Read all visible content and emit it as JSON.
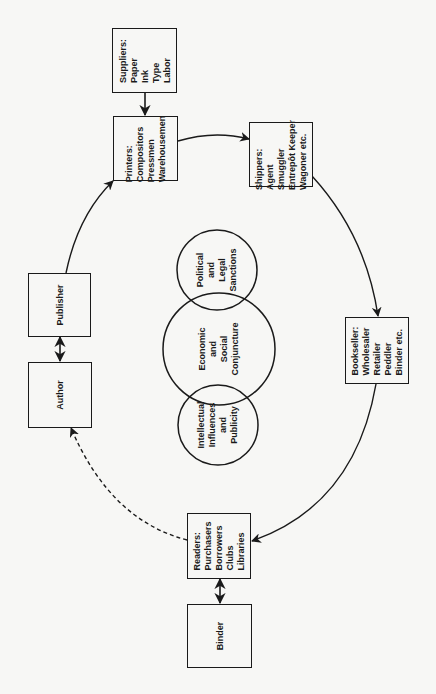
{
  "diagram": {
    "nodes": {
      "suppliers": {
        "title": "Suppliers:",
        "items": [
          "Paper",
          "Ink",
          "Type",
          "Labor"
        ]
      },
      "printers": {
        "title": "Printers:",
        "items": [
          "Compositors",
          "Pressmen",
          "Warehousemen"
        ]
      },
      "shippers": {
        "title": "Shippers:",
        "items": [
          "Agent",
          "Smuggler",
          "Entrepôt Keeper",
          "Wagoner etc."
        ]
      },
      "bookseller": {
        "title": "Bookseller:",
        "items": [
          "Wholesaler",
          "Retailer",
          "Peddler",
          "Binder etc."
        ]
      },
      "readers": {
        "title": "Readers:",
        "items": [
          "Purchasers",
          "Borrowers",
          "Clubs",
          "Libraries"
        ]
      },
      "binder": {
        "title": "Binder"
      },
      "author": {
        "title": "Author"
      },
      "publisher": {
        "title": "Publisher"
      }
    },
    "circles": {
      "political": {
        "lines": [
          "Political",
          "and",
          "Legal",
          "Sanctions"
        ]
      },
      "economic": {
        "lines": [
          "Economic",
          "and",
          "Social",
          "Conjuncture"
        ]
      },
      "intellectual": {
        "lines": [
          "Intellectual",
          "Influences",
          "and",
          "Publicity"
        ]
      }
    },
    "edges": [
      {
        "from": "suppliers",
        "to": "printers",
        "style": "solid"
      },
      {
        "from": "printers",
        "to": "shippers",
        "style": "solid"
      },
      {
        "from": "shippers",
        "to": "bookseller",
        "style": "solid"
      },
      {
        "from": "bookseller",
        "to": "readers",
        "style": "solid"
      },
      {
        "from": "readers",
        "to": "author",
        "style": "dashed"
      },
      {
        "from": "author",
        "to": "publisher",
        "style": "bidirectional"
      },
      {
        "from": "publisher",
        "to": "printers",
        "style": "solid"
      },
      {
        "from": "readers",
        "to": "binder",
        "style": "bidirectional"
      }
    ]
  }
}
